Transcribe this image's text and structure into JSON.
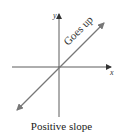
{
  "diagram": {
    "x_axis_label": "x",
    "y_axis_label": "y",
    "line_annotation": "Goes up",
    "caption": "Positive slope",
    "line_slope_sign": "positive",
    "colors": {
      "axes": "#333333",
      "line": "#777777",
      "text": "#222222"
    }
  }
}
